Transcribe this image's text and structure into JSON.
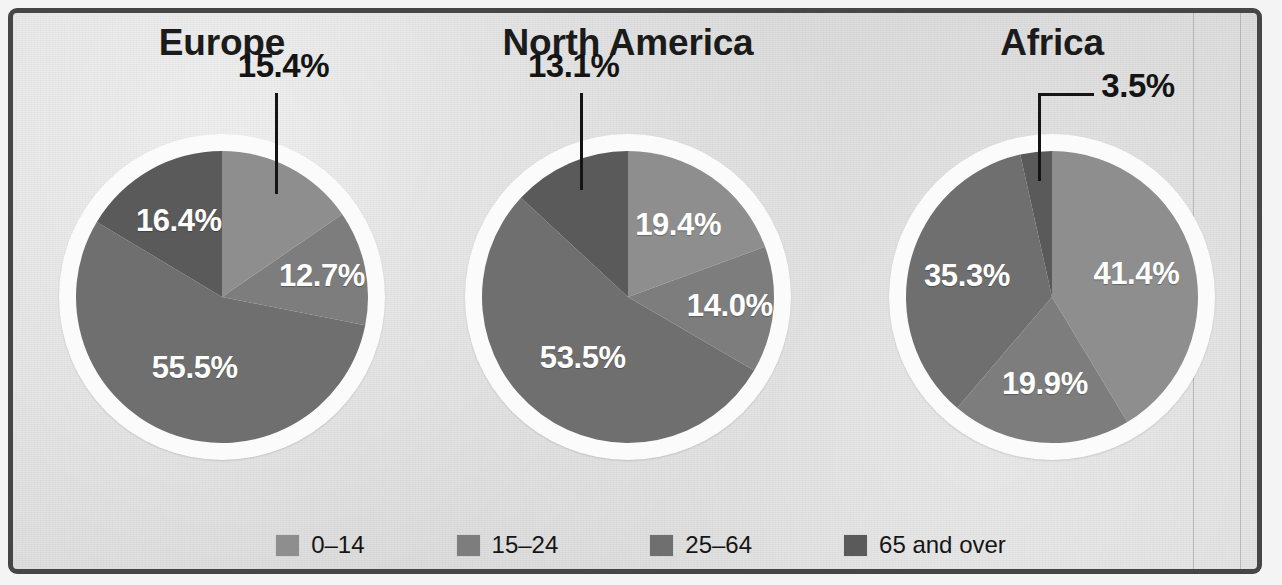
{
  "figure": {
    "background_color": "#d9d9d9",
    "frame_color": "#464646"
  },
  "legend": {
    "items": [
      {
        "label": "0–14",
        "color": "#8e8e8e"
      },
      {
        "label": "15–24",
        "color": "#7d7d7d"
      },
      {
        "label": "25–64",
        "color": "#6f6f6f"
      },
      {
        "label": "65 and over",
        "color": "#5a5a5a"
      }
    ]
  },
  "chart_data": {
    "type": "pie",
    "title": "",
    "categories": [
      "0–14",
      "15–24",
      "25–64",
      "65 and over"
    ],
    "colors": [
      "#8e8e8e",
      "#7d7d7d",
      "#6f6f6f",
      "#5a5a5a"
    ],
    "unit": "%",
    "start_angle_deg": 0,
    "direction": "clockwise",
    "charts": [
      {
        "name": "europe",
        "title": "Europe",
        "values": [
          15.4,
          12.7,
          55.5,
          16.4
        ],
        "labels": [
          "15.4%",
          "12.7%",
          "55.5%",
          "16.4%"
        ],
        "callout_index": 0
      },
      {
        "name": "north-america",
        "title": "North America",
        "values": [
          19.4,
          14.0,
          53.5,
          13.1
        ],
        "labels": [
          "19.4%",
          "14.0%",
          "53.5%",
          "13.1%"
        ],
        "callout_index": 3
      },
      {
        "name": "africa",
        "title": "Africa",
        "values": [
          41.4,
          19.9,
          35.3,
          3.5
        ],
        "labels": [
          "41.4%",
          "19.9%",
          "35.3%",
          "3.5%"
        ],
        "callout_index": 3
      }
    ]
  }
}
